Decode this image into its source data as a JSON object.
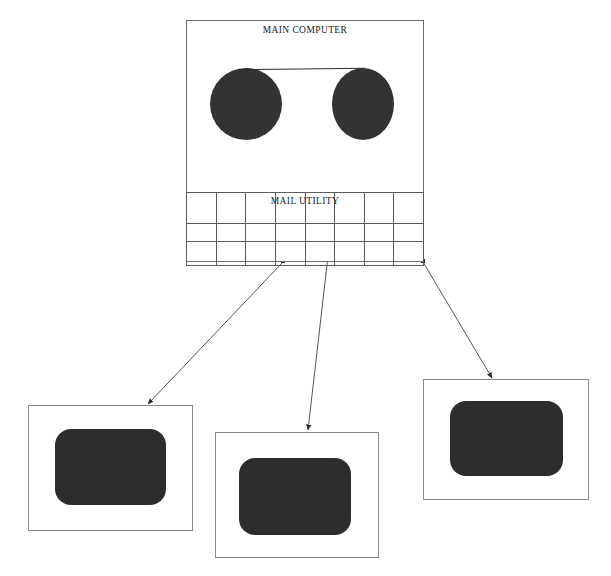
{
  "diagram": {
    "type": "block-diagram",
    "title": "",
    "main_unit": {
      "label": "MAIN COMPUTER",
      "subsystem_label": "MAIL UTILITY",
      "grid": {
        "columns": 8,
        "rows": 3
      },
      "media": [
        {
          "name": "disc-left"
        },
        {
          "name": "disc-right"
        }
      ]
    },
    "terminals": [
      {
        "name": "terminal-1"
      },
      {
        "name": "terminal-2"
      },
      {
        "name": "terminal-3"
      }
    ],
    "connections": [
      {
        "from": "mail-utility",
        "to": "terminal-1"
      },
      {
        "from": "mail-utility",
        "to": "terminal-2"
      },
      {
        "from": "mail-utility",
        "to": "terminal-3"
      }
    ],
    "colors": {
      "disc_fill": "#333333",
      "screen_fill": "#2d2d2d",
      "outline": "#6f6f6f",
      "connector": "#555555"
    }
  }
}
